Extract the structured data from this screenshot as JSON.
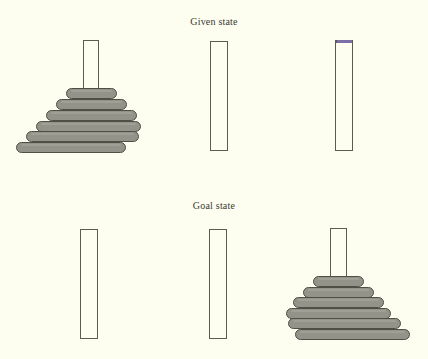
{
  "figure": {
    "title_given": "Given state",
    "title_goal": "Goal state",
    "background_color": "#fdfdf0",
    "disk_color": "#93938a",
    "disk_border_color": "#4f4f46",
    "peg_border_color": "#5b5b50",
    "accent_color": "#7c6fa8",
    "disk_count": 6
  },
  "given_state": {
    "label": "Given state",
    "pegs": [
      {
        "name": "peg-a",
        "index": 1,
        "x": 83,
        "y": 40,
        "width": 16,
        "height": 111,
        "has_accent_cap": false,
        "disk_count": 6,
        "disks": [
          {
            "size": 1,
            "x": 66,
            "y": 88,
            "width": 51,
            "height": 11
          },
          {
            "size": 2,
            "x": 56,
            "y": 99,
            "width": 71,
            "height": 11
          },
          {
            "size": 3,
            "x": 46,
            "y": 110,
            "width": 91,
            "height": 11
          },
          {
            "size": 4,
            "x": 36,
            "y": 121,
            "width": 105,
            "height": 11
          },
          {
            "size": 5,
            "x": 26,
            "y": 131,
            "width": 113,
            "height": 11
          },
          {
            "size": 6,
            "x": 16,
            "y": 142,
            "width": 110,
            "height": 11
          }
        ]
      },
      {
        "name": "peg-b",
        "index": 2,
        "x": 210,
        "y": 41,
        "width": 18,
        "height": 110,
        "has_accent_cap": false,
        "disk_count": 0,
        "disks": []
      },
      {
        "name": "peg-c",
        "index": 3,
        "x": 335,
        "y": 40,
        "width": 18,
        "height": 111,
        "has_accent_cap": true,
        "accent_cap": {
          "x": 336,
          "y": 40,
          "width": 17,
          "height": 3
        },
        "disk_count": 0,
        "disks": []
      }
    ]
  },
  "goal_state": {
    "label": "Goal state",
    "pegs": [
      {
        "name": "peg-a",
        "index": 1,
        "x": 80,
        "y": 229,
        "width": 18,
        "height": 110,
        "has_accent_cap": false,
        "disk_count": 0,
        "disks": []
      },
      {
        "name": "peg-b",
        "index": 2,
        "x": 209,
        "y": 229,
        "width": 18,
        "height": 110,
        "has_accent_cap": false,
        "disk_count": 0,
        "disks": []
      },
      {
        "name": "peg-c",
        "index": 3,
        "x": 330,
        "y": 228,
        "width": 17,
        "height": 111,
        "has_accent_cap": false,
        "disk_count": 6,
        "disks": [
          {
            "size": 1,
            "x": 313,
            "y": 276,
            "width": 51,
            "height": 11
          },
          {
            "size": 2,
            "x": 303,
            "y": 287,
            "width": 71,
            "height": 11
          },
          {
            "size": 3,
            "x": 293,
            "y": 297,
            "width": 91,
            "height": 11
          },
          {
            "size": 4,
            "x": 286,
            "y": 308,
            "width": 105,
            "height": 11
          },
          {
            "size": 5,
            "x": 288,
            "y": 318,
            "width": 113,
            "height": 11
          },
          {
            "size": 6,
            "x": 295,
            "y": 329,
            "width": 115,
            "height": 11
          }
        ]
      }
    ]
  }
}
